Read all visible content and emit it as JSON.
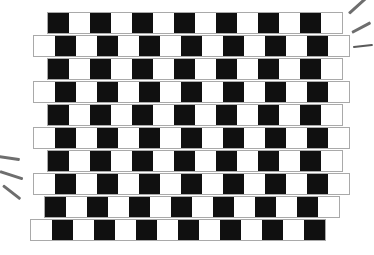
{
  "figure": {
    "colors": {
      "tile_black": "#101010",
      "tile_white": "#ffffff",
      "mortar": "#a9a9a9",
      "background": "#ffffff",
      "stroke": "#6e6e6e"
    },
    "geometry": {
      "cell_width": 21,
      "cell_height": 20,
      "row_count": 10,
      "row_pitch": 23,
      "top": 12,
      "mortar_thickness": 1
    },
    "rows": [
      {
        "index": 1,
        "left": 47,
        "top": 12,
        "offset": 14,
        "lead": "k",
        "cells": [
          "k",
          "w",
          "k",
          "w",
          "k",
          "w",
          "k",
          "w",
          "k",
          "w",
          "k",
          "w",
          "k",
          "w"
        ]
      },
      {
        "index": 2,
        "left": 33,
        "top": 35,
        "offset": 0,
        "lead": "w",
        "cells": [
          "w",
          "k",
          "w",
          "k",
          "w",
          "k",
          "w",
          "k",
          "w",
          "k",
          "w",
          "k",
          "w",
          "k",
          "w"
        ]
      },
      {
        "index": 3,
        "left": 47,
        "top": 58,
        "offset": 14,
        "lead": "k",
        "cells": [
          "k",
          "w",
          "k",
          "w",
          "k",
          "w",
          "k",
          "w",
          "k",
          "w",
          "k",
          "w",
          "k",
          "w"
        ]
      },
      {
        "index": 4,
        "left": 33,
        "top": 81,
        "offset": 0,
        "lead": "w",
        "cells": [
          "w",
          "k",
          "w",
          "k",
          "w",
          "k",
          "w",
          "k",
          "w",
          "k",
          "w",
          "k",
          "w",
          "k",
          "w"
        ]
      },
      {
        "index": 5,
        "left": 47,
        "top": 104,
        "offset": 14,
        "lead": "k",
        "cells": [
          "k",
          "w",
          "k",
          "w",
          "k",
          "w",
          "k",
          "w",
          "k",
          "w",
          "k",
          "w",
          "k",
          "w"
        ]
      },
      {
        "index": 6,
        "left": 33,
        "top": 127,
        "offset": 0,
        "lead": "w",
        "cells": [
          "w",
          "k",
          "w",
          "k",
          "w",
          "k",
          "w",
          "k",
          "w",
          "k",
          "w",
          "k",
          "w",
          "k",
          "w"
        ]
      },
      {
        "index": 7,
        "left": 47,
        "top": 150,
        "offset": 14,
        "lead": "k",
        "cells": [
          "k",
          "w",
          "k",
          "w",
          "k",
          "w",
          "k",
          "w",
          "k",
          "w",
          "k",
          "w",
          "k",
          "w"
        ]
      },
      {
        "index": 8,
        "left": 33,
        "top": 173,
        "offset": 0,
        "lead": "w",
        "cells": [
          "w",
          "k",
          "w",
          "k",
          "w",
          "k",
          "w",
          "k",
          "w",
          "k",
          "w",
          "k",
          "w",
          "k",
          "w"
        ]
      },
      {
        "index": 9,
        "left": 44,
        "top": 196,
        "offset": 11,
        "lead": "k",
        "cells": [
          "k",
          "w",
          "k",
          "w",
          "k",
          "w",
          "k",
          "w",
          "k",
          "w",
          "k",
          "w",
          "k",
          "w"
        ]
      },
      {
        "index": 10,
        "left": 30,
        "top": 219,
        "offset": 0,
        "lead": "w",
        "cells": [
          "w",
          "k",
          "w",
          "k",
          "w",
          "k",
          "w",
          "k",
          "w",
          "k",
          "w",
          "k",
          "w",
          "k"
        ]
      }
    ],
    "sparkles": [
      {
        "group": "top-right",
        "index": 1,
        "left": 349,
        "top": 12,
        "length": 23,
        "thickness": 3,
        "rotate": -42
      },
      {
        "group": "top-right",
        "index": 2,
        "left": 352,
        "top": 31,
        "length": 21,
        "thickness": 3,
        "rotate": -28
      },
      {
        "group": "top-right",
        "index": 3,
        "left": 353,
        "top": 46,
        "length": 20,
        "thickness": 2,
        "rotate": -6
      },
      {
        "group": "mid-left",
        "index": 1,
        "left": -2,
        "top": 155,
        "length": 22,
        "thickness": 3,
        "rotate": 8
      },
      {
        "group": "mid-left",
        "index": 2,
        "left": 0,
        "top": 170,
        "length": 24,
        "thickness": 3,
        "rotate": 18
      },
      {
        "group": "mid-left",
        "index": 3,
        "left": 3,
        "top": 184,
        "length": 22,
        "thickness": 3,
        "rotate": 38
      }
    ]
  }
}
